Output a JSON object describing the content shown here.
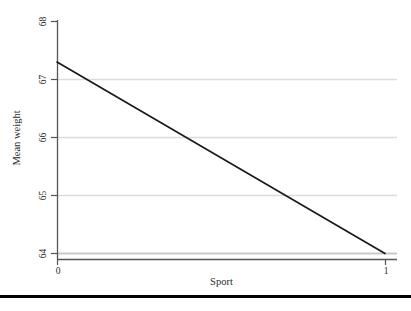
{
  "chart_data": {
    "type": "line",
    "title": "",
    "xlabel": "Sport",
    "ylabel": "Mean weight",
    "x": [
      0,
      1
    ],
    "series": [
      {
        "name": "Mean weight",
        "values": [
          67.3,
          64.0
        ]
      }
    ],
    "xlim": [
      0,
      1
    ],
    "ylim": [
      64,
      68
    ],
    "xticks": [
      0,
      1
    ],
    "xtick_labels": [
      "0",
      "1"
    ],
    "yticks": [
      64,
      65,
      66,
      67,
      68
    ],
    "ytick_labels": [
      "64",
      "65",
      "66",
      "67",
      "68"
    ],
    "gridlines_y": [
      64,
      65,
      66,
      67
    ],
    "grid": true,
    "grid_axis": "y",
    "legend": false,
    "legend_position": "none",
    "line_color": "#1a1a1a",
    "grid_color": "#d9d9d9",
    "axis_color": "#4d4d4d",
    "background_color": "#ffffff"
  },
  "axes": {
    "y": {
      "title": "Mean weight",
      "ticks": [
        {
          "label": "68",
          "value": 68
        },
        {
          "label": "67",
          "value": 67
        },
        {
          "label": "66",
          "value": 66
        },
        {
          "label": "65",
          "value": 65
        },
        {
          "label": "64",
          "value": 64
        }
      ]
    },
    "x": {
      "title": "Sport",
      "ticks": [
        {
          "label": "0",
          "value": 0
        },
        {
          "label": "1",
          "value": 1
        }
      ]
    }
  }
}
